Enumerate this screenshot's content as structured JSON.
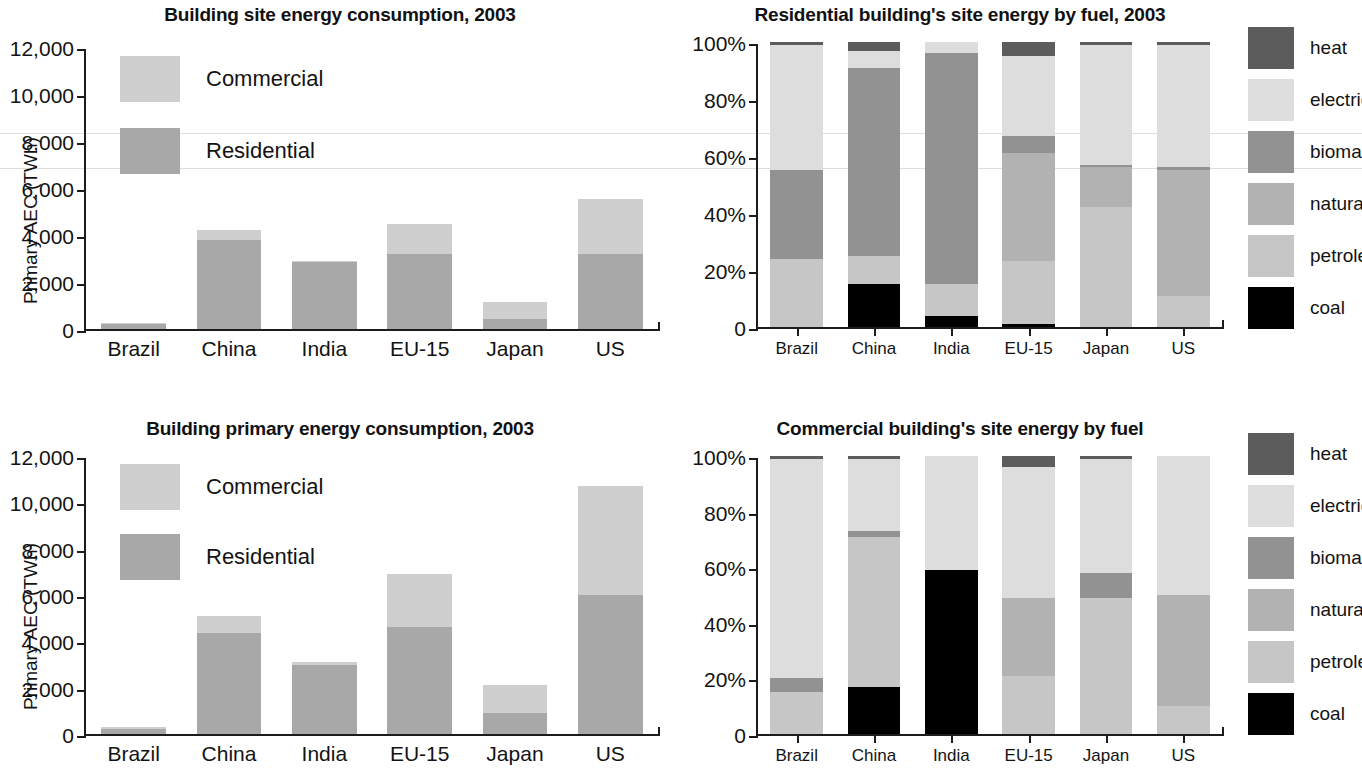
{
  "palette": {
    "commercial": "#cfcfcf",
    "residential": "#a8a8a8",
    "heat": "#5c5c5c",
    "electricity": "#dddddd",
    "biomass": "#929292",
    "natural_gas": "#b2b2b2",
    "petroleum": "#c6c6c6",
    "coal": "#000000",
    "axis": "#1c1c1c",
    "text": "#131313"
  },
  "charts": [
    {
      "id": "site-energy",
      "chart_data": {
        "type": "bar",
        "title": "Building site energy consumption, 2003",
        "xlabel": "",
        "ylabel": "Primary AEC (TWh)",
        "ylim": [
          0,
          12000
        ],
        "yticks": [
          0,
          2000,
          4000,
          6000,
          8000,
          10000,
          12000
        ],
        "ytick_labels": [
          "0",
          "2,000",
          "4,000",
          "6,000",
          "8,000",
          "10,000",
          "12,000"
        ],
        "grid": false,
        "stacked": true,
        "legend_position": "inside-top-left",
        "categories": [
          "Brazil",
          "China",
          "India",
          "EU-15",
          "Japan",
          "US"
        ],
        "series": [
          {
            "name": "Residential",
            "color_key": "residential",
            "values": [
              200,
              3800,
              2850,
              3180,
              420,
              3200
            ]
          },
          {
            "name": "Commercial",
            "color_key": "commercial",
            "values": [
              60,
              400,
              50,
              1280,
              740,
              2340
            ]
          }
        ],
        "totals": [
          260,
          4200,
          2900,
          4460,
          1160,
          5540
        ]
      }
    },
    {
      "id": "residential-fuel",
      "chart_data": {
        "type": "bar",
        "title": "Residential building's site energy by fuel, 2003",
        "xlabel": "",
        "ylabel": "",
        "ylim": [
          0,
          100
        ],
        "yticks": [
          0,
          20,
          40,
          60,
          80,
          100
        ],
        "ytick_labels": [
          "0",
          "20%",
          "40%",
          "60%",
          "80%",
          "100%"
        ],
        "grid": false,
        "stacked": true,
        "stack_unit": "percent",
        "legend_position": "right",
        "categories": [
          "Brazil",
          "China",
          "India",
          "EU-15",
          "Japan",
          "US"
        ],
        "series": [
          {
            "name": "coal",
            "color_key": "coal",
            "values": [
              0,
              15,
              4,
              1,
              0,
              0
            ]
          },
          {
            "name": "petroleum",
            "color_key": "petroleum",
            "values": [
              24,
              10,
              11,
              22,
              42,
              11
            ]
          },
          {
            "name": "natural gas",
            "color_key": "natural_gas",
            "values": [
              0,
              0,
              0,
              38,
              14,
              44
            ]
          },
          {
            "name": "biomass",
            "color_key": "biomass",
            "values": [
              31,
              66,
              81,
              6,
              1,
              1
            ]
          },
          {
            "name": "electricity",
            "color_key": "electricity",
            "values": [
              44,
              6,
              4,
              28,
              42,
              43
            ]
          },
          {
            "name": "heat",
            "color_key": "heat",
            "values": [
              1,
              3,
              0,
              5,
              1,
              1
            ]
          }
        ]
      }
    },
    {
      "id": "primary-energy",
      "chart_data": {
        "type": "bar",
        "title": "Building primary energy consumption, 2003",
        "xlabel": "",
        "ylabel": "Primary AEC (TWh)",
        "ylim": [
          0,
          12000
        ],
        "yticks": [
          0,
          2000,
          4000,
          6000,
          8000,
          10000,
          12000
        ],
        "ytick_labels": [
          "0",
          "2,000",
          "4,000",
          "6,000",
          "8,000",
          "10,000",
          "12,000"
        ],
        "grid": false,
        "stacked": true,
        "legend_position": "inside-top-left",
        "categories": [
          "Brazil",
          "China",
          "India",
          "EU-15",
          "Japan",
          "US"
        ],
        "series": [
          {
            "name": "Residential",
            "color_key": "residential",
            "values": [
              210,
              4380,
              3000,
              4600,
              900,
              6020
            ]
          },
          {
            "name": "Commercial",
            "color_key": "commercial",
            "values": [
              90,
              700,
              100,
              2320,
              1220,
              4680
            ]
          }
        ],
        "totals": [
          300,
          5080,
          3100,
          6920,
          2120,
          10700
        ]
      }
    },
    {
      "id": "commercial-fuel",
      "chart_data": {
        "type": "bar",
        "title": "Commercial building's site energy by fuel",
        "xlabel": "",
        "ylabel": "",
        "ylim": [
          0,
          100
        ],
        "yticks": [
          0,
          20,
          40,
          60,
          80,
          100
        ],
        "ytick_labels": [
          "0",
          "20%",
          "40%",
          "60%",
          "80%",
          "100%"
        ],
        "grid": false,
        "stacked": true,
        "stack_unit": "percent",
        "legend_position": "right",
        "categories": [
          "Brazil",
          "China",
          "India",
          "EU-15",
          "Japan",
          "US"
        ],
        "series": [
          {
            "name": "coal",
            "color_key": "coal",
            "values": [
              0,
              17,
              59,
              0,
              0,
              0
            ]
          },
          {
            "name": "petroleum",
            "color_key": "petroleum",
            "values": [
              15,
              54,
              0,
              21,
              49,
              10
            ]
          },
          {
            "name": "natural gas",
            "color_key": "natural_gas",
            "values": [
              0,
              0,
              0,
              28,
              0,
              40
            ]
          },
          {
            "name": "biomass",
            "color_key": "biomass",
            "values": [
              5,
              2,
              0,
              0,
              9,
              0
            ]
          },
          {
            "name": "electricity",
            "color_key": "electricity",
            "values": [
              79,
              26,
              41,
              47,
              41,
              50
            ]
          },
          {
            "name": "heat",
            "color_key": "heat",
            "values": [
              1,
              1,
              0,
              4,
              1,
              0
            ]
          }
        ]
      }
    }
  ],
  "fuel_legend": {
    "items": [
      {
        "label": "heat",
        "color_key": "heat"
      },
      {
        "label": "electricity",
        "color_key": "electricity"
      },
      {
        "label": "biomass",
        "color_key": "biomass"
      },
      {
        "label": "natural gas",
        "color_key": "natural_gas"
      },
      {
        "label": "petroleum",
        "color_key": "petroleum"
      },
      {
        "label": "coal",
        "color_key": "coal"
      }
    ]
  }
}
